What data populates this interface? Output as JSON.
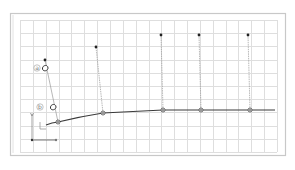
{
  "diagram": {
    "width": 295,
    "height": 170,
    "colors": {
      "background": "#ffffff",
      "frame": "#c8c8c8",
      "frame_inner": "#e2e2e2",
      "grid": "#dedede",
      "curve": "#3a3a3a",
      "handle_line": "#9a9a9a",
      "point": "#222222",
      "node_fill": "#777777",
      "label_circle": "#9a9a9a"
    },
    "frame": {
      "x": 10,
      "y": 13,
      "w": 275,
      "h": 142
    },
    "grid": {
      "x": 20,
      "y": 20,
      "w": 257,
      "h": 132,
      "cols": 20,
      "rows": 10
    },
    "curve_nodes": [
      {
        "x": 58,
        "y": 122
      },
      {
        "x": 103,
        "y": 113
      },
      {
        "x": 163,
        "y": 110
      },
      {
        "x": 201,
        "y": 110
      },
      {
        "x": 250,
        "y": 110
      }
    ],
    "curve_start": {
      "x": 46,
      "y": 125
    },
    "curve_end": {
      "x": 275,
      "y": 110
    },
    "handles": [
      {
        "from": {
          "x": 58,
          "y": 122
        },
        "to": {
          "x": 45,
          "y": 60
        }
      },
      {
        "from": {
          "x": 103,
          "y": 113
        },
        "to": {
          "x": 96,
          "y": 47
        }
      },
      {
        "from": {
          "x": 163,
          "y": 110
        },
        "to": {
          "x": 161,
          "y": 35
        }
      },
      {
        "from": {
          "x": 201,
          "y": 110
        },
        "to": {
          "x": 199,
          "y": 35
        }
      },
      {
        "from": {
          "x": 250,
          "y": 110
        },
        "to": {
          "x": 248,
          "y": 35
        }
      }
    ],
    "labels": [
      {
        "id": "a",
        "text": "a",
        "x": 37,
        "y": 68
      },
      {
        "id": "b",
        "text": "b",
        "x": 40,
        "y": 107
      }
    ],
    "markers": [
      {
        "name": "grab-cursor-a",
        "x": 45,
        "y": 68
      },
      {
        "name": "grab-cursor-b",
        "x": 53,
        "y": 107
      }
    ],
    "axis": {
      "origin": {
        "x": 32,
        "y": 140
      },
      "y_tick": {
        "x": 32,
        "y": 114
      },
      "x_tick": {
        "x": 56,
        "y": 140
      },
      "corner_glyph": {
        "x": 40,
        "y": 122
      }
    }
  }
}
